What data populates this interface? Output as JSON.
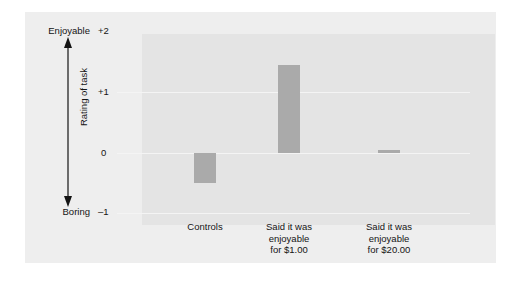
{
  "chart_data": {
    "type": "bar",
    "title": "",
    "subtitle": "",
    "xlabel": "",
    "ylabel": "Rating of task",
    "categories": [
      "Controls",
      "Said it was\nenjoyable\nfor $1.00",
      "Said it was\nenjoyable\nfor $20.00"
    ],
    "values": [
      -0.5,
      1.45,
      0.05
    ],
    "ylim": [
      -1,
      2
    ],
    "yticks": [
      2,
      1,
      0,
      -1
    ],
    "ytick_labels": [
      "+2",
      "+1",
      "0",
      "–1"
    ],
    "axis_high_label": "Enjoyable",
    "axis_low_label": "Boring",
    "grid": true,
    "grid_axis": "y",
    "legend": "none",
    "bar_color": "#aaaaaa",
    "plot_background": "#e4e4e4",
    "figure_background": "#eeeeee",
    "gridline_color": "#f4f4f4",
    "text_color": "#141414"
  },
  "axis": {
    "high_label": "Enjoyable",
    "low_label": "Boring",
    "title": "Rating of task",
    "ticks": [
      {
        "label": "+2",
        "value": 2
      },
      {
        "label": "+1",
        "value": 1
      },
      {
        "label": "0",
        "value": 0
      },
      {
        "label": "–1",
        "value": -1
      }
    ]
  },
  "bars": [
    {
      "label": "Controls",
      "value": -0.5
    },
    {
      "label": "Said it was\nenjoyable\nfor $1.00",
      "value": 1.45
    },
    {
      "label": "Said it was\nenjoyable\nfor $20.00",
      "value": 0.05
    }
  ]
}
